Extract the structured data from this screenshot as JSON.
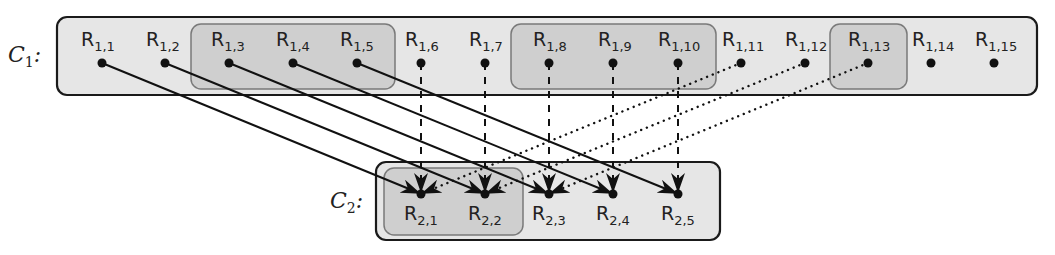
{
  "diagram": {
    "type": "mapping",
    "colors": {
      "outer_fill": "#e6e6e6",
      "outer_stroke": "#1a1a1a",
      "group_fill": "#cfcfcf",
      "group_stroke": "#7a7a7a",
      "edge": "#111111"
    },
    "clusters": [
      {
        "id": "C1",
        "label": "C",
        "label_sub": "1",
        "label_suffix": ":",
        "nodes": [
          {
            "id": "R1,1",
            "label": "R",
            "sub": "1,1"
          },
          {
            "id": "R1,2",
            "label": "R",
            "sub": "1,2"
          },
          {
            "id": "R1,3",
            "label": "R",
            "sub": "1,3"
          },
          {
            "id": "R1,4",
            "label": "R",
            "sub": "1,4"
          },
          {
            "id": "R1,5",
            "label": "R",
            "sub": "1,5"
          },
          {
            "id": "R1,6",
            "label": "R",
            "sub": "1,6"
          },
          {
            "id": "R1,7",
            "label": "R",
            "sub": "1,7"
          },
          {
            "id": "R1,8",
            "label": "R",
            "sub": "1,8"
          },
          {
            "id": "R1,9",
            "label": "R",
            "sub": "1,9"
          },
          {
            "id": "R1,10",
            "label": "R",
            "sub": "1,10"
          },
          {
            "id": "R1,11",
            "label": "R",
            "sub": "1,11"
          },
          {
            "id": "R1,12",
            "label": "R",
            "sub": "1,12"
          },
          {
            "id": "R1,13",
            "label": "R",
            "sub": "1,13"
          },
          {
            "id": "R1,14",
            "label": "R",
            "sub": "1,14"
          },
          {
            "id": "R1,15",
            "label": "R",
            "sub": "1,15"
          }
        ],
        "groups": [
          [
            "R1,3",
            "R1,4",
            "R1,5"
          ],
          [
            "R1,8",
            "R1,9",
            "R1,10"
          ],
          [
            "R1,13"
          ]
        ]
      },
      {
        "id": "C2",
        "label": "C",
        "label_sub": "2",
        "label_suffix": ":",
        "nodes": [
          {
            "id": "R2,1",
            "label": "R",
            "sub": "2,1"
          },
          {
            "id": "R2,2",
            "label": "R",
            "sub": "2,2"
          },
          {
            "id": "R2,3",
            "label": "R",
            "sub": "2,3"
          },
          {
            "id": "R2,4",
            "label": "R",
            "sub": "2,4"
          },
          {
            "id": "R2,5",
            "label": "R",
            "sub": "2,5"
          }
        ],
        "groups": [
          [
            "R2,1",
            "R2,2"
          ]
        ]
      }
    ],
    "edges": [
      {
        "from": "R1,1",
        "to": "R2,1",
        "style": "solid"
      },
      {
        "from": "R1,2",
        "to": "R2,2",
        "style": "solid"
      },
      {
        "from": "R1,3",
        "to": "R2,3",
        "style": "solid"
      },
      {
        "from": "R1,4",
        "to": "R2,4",
        "style": "solid"
      },
      {
        "from": "R1,5",
        "to": "R2,5",
        "style": "solid"
      },
      {
        "from": "R1,6",
        "to": "R2,1",
        "style": "dashed"
      },
      {
        "from": "R1,7",
        "to": "R2,2",
        "style": "dashed"
      },
      {
        "from": "R1,8",
        "to": "R2,3",
        "style": "dashed"
      },
      {
        "from": "R1,9",
        "to": "R2,4",
        "style": "dashed"
      },
      {
        "from": "R1,10",
        "to": "R2,5",
        "style": "dashed"
      },
      {
        "from": "R1,11",
        "to": "R2,1",
        "style": "dotted"
      },
      {
        "from": "R1,12",
        "to": "R2,2",
        "style": "dotted"
      },
      {
        "from": "R1,13",
        "to": "R2,3",
        "style": "dotted"
      }
    ]
  }
}
